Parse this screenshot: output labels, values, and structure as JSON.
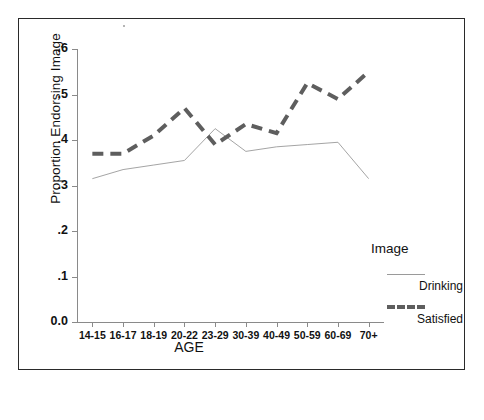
{
  "chart_data": {
    "type": "line",
    "title": "",
    "xlabel": "AGE",
    "ylabel": "Proportion Endorsing Image",
    "categories": [
      "14-15",
      "16-17",
      "18-19",
      "20-22",
      "23-29",
      "30-39",
      "40-49",
      "50-59",
      "60-69",
      "70+"
    ],
    "ylim": [
      0.0,
      0.6
    ],
    "ytick_labels": [
      "0.0",
      ".1",
      ".2",
      ".3",
      ".4",
      ".5",
      ".6"
    ],
    "ytick_values": [
      0.0,
      0.1,
      0.2,
      0.3,
      0.4,
      0.5,
      0.6
    ],
    "grid": false,
    "legend_position": "right",
    "legend_title": "Image",
    "series": [
      {
        "name": "Drinking",
        "style": "solid-thin",
        "color": "#9a9a9a",
        "values": [
          0.315,
          0.335,
          0.345,
          0.355,
          0.425,
          0.375,
          0.385,
          0.39,
          0.395,
          0.315
        ]
      },
      {
        "name": "Satisfied",
        "style": "dashed-thick",
        "color": "#5e5e5e",
        "values": [
          0.37,
          0.37,
          0.41,
          0.47,
          0.39,
          0.435,
          0.415,
          0.525,
          0.49,
          0.55
        ]
      }
    ]
  },
  "legend": {
    "title": "Image",
    "entries": [
      {
        "label": "Drinking",
        "style": "solid"
      },
      {
        "label": "Satisfied",
        "style": "dashed"
      }
    ]
  }
}
